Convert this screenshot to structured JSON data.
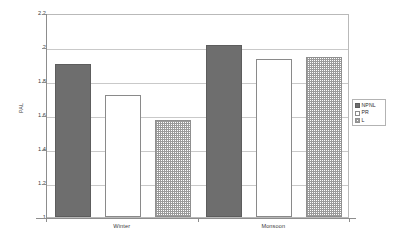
{
  "chart_data": {
    "type": "bar",
    "title": "",
    "xlabel": "",
    "ylabel": "PAL",
    "categories": [
      "Winter",
      "Monsoon"
    ],
    "series": [
      {
        "name": "NPNL",
        "values": [
          1.9,
          2.01
        ],
        "fill": "solid-gray",
        "color": "#6e6e6e"
      },
      {
        "name": "PR",
        "values": [
          1.72,
          1.93
        ],
        "fill": "white",
        "color": "#ffffff"
      },
      {
        "name": "L",
        "values": [
          1.57,
          1.94
        ],
        "fill": "crosshatch",
        "color": "#9a9a9a"
      }
    ],
    "ylim": [
      1,
      2.2
    ],
    "ytick_values": [
      1,
      1.2,
      1.4,
      1.6,
      1.8,
      2,
      2.2
    ],
    "ytick_labels": [
      "1",
      "1.2",
      "1.4",
      "1.6",
      "1.8",
      "2",
      "2.2"
    ],
    "grid": "horizontal",
    "legend_position": "right"
  },
  "legend": {
    "entries": [
      {
        "label": "NPNL"
      },
      {
        "label": "PR"
      },
      {
        "label": "L"
      }
    ]
  },
  "axes": {
    "y_title": "PAL"
  }
}
